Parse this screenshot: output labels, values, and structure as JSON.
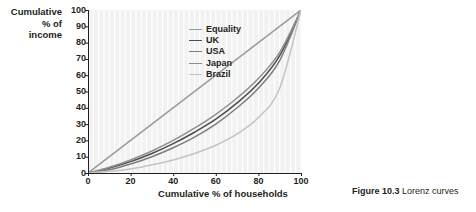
{
  "figure": {
    "caption_label": "Figure 10.3",
    "caption_text": "Lorenz curves"
  },
  "axes": {
    "ylabel_lines": [
      "Cumulative",
      "% of",
      "income"
    ],
    "ylabel": "Cumulative % of income",
    "xlabel": "Cumulative % of households",
    "yticks": [
      100,
      90,
      80,
      70,
      60,
      50,
      40,
      30,
      20,
      10,
      0
    ],
    "xticks": [
      0,
      20,
      40,
      60,
      80,
      100
    ]
  },
  "colors": {
    "plot_background": "#f2f2f2",
    "gridline": "#ffffff",
    "axis": "#231f20",
    "text": "#231f20",
    "equality": "#9a9a9a",
    "uk": "#4d4d4d",
    "usa": "#7d7d7d",
    "japan": "#8f8f8f",
    "brazil": "#c4c4c4"
  },
  "chart_data": {
    "type": "line",
    "title": "Lorenz curves",
    "xlabel": "Cumulative % of households",
    "ylabel": "Cumulative % of income",
    "xlim": [
      0,
      100
    ],
    "ylim": [
      0,
      100
    ],
    "xticks": [
      0,
      20,
      40,
      60,
      80,
      100
    ],
    "yticks": [
      0,
      10,
      20,
      30,
      40,
      50,
      60,
      70,
      80,
      90,
      100
    ],
    "grid": "vertical-only",
    "legend_position": "inside-top-left",
    "x": [
      0,
      10,
      20,
      30,
      40,
      50,
      60,
      70,
      80,
      90,
      100
    ],
    "series": [
      {
        "name": "Equality",
        "color": "#9a9a9a",
        "width": 1.5,
        "values": [
          0,
          10,
          20,
          30,
          40,
          50,
          60,
          70,
          80,
          90,
          100
        ]
      },
      {
        "name": "UK",
        "color": "#4d4d4d",
        "width": 1.5,
        "values": [
          0,
          3,
          7,
          12,
          18,
          25,
          33,
          43,
          55,
          72,
          100
        ]
      },
      {
        "name": "USA",
        "color": "#7d7d7d",
        "width": 1.5,
        "values": [
          0,
          2,
          5.5,
          10,
          15.5,
          22,
          30,
          40,
          52,
          69,
          100
        ]
      },
      {
        "name": "Japan",
        "color": "#8f8f8f",
        "width": 1.5,
        "values": [
          0,
          3.5,
          8,
          13.5,
          20,
          27.5,
          36,
          46,
          58,
          74,
          100
        ]
      },
      {
        "name": "Brazil",
        "color": "#c4c4c4",
        "width": 1.5,
        "values": [
          0,
          1,
          2.5,
          5,
          8,
          12,
          17,
          24,
          34,
          52,
          100
        ]
      }
    ]
  },
  "legend": {
    "items": [
      {
        "label": "Equality",
        "color": "#9a9a9a"
      },
      {
        "label": "UK",
        "color": "#4d4d4d"
      },
      {
        "label": "USA",
        "color": "#7d7d7d"
      },
      {
        "label": "Japan",
        "color": "#8f8f8f"
      },
      {
        "label": "Brazil",
        "color": "#c4c4c4"
      }
    ]
  }
}
